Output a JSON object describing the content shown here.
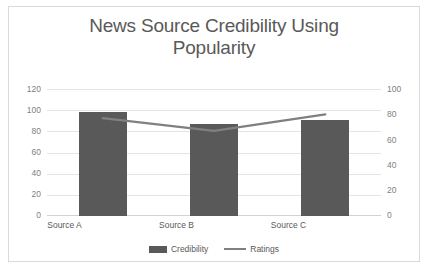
{
  "chart_data": {
    "type": "bar",
    "title": "News Source Credibility Using Popularity",
    "title_line1": "News Source Credibility Using",
    "title_line2": "Popularity",
    "xlabel": "",
    "ylabel": "",
    "categories": [
      "Source A",
      "Source B",
      "Source C"
    ],
    "series": [
      {
        "name": "Credibility",
        "type": "bar",
        "axis": "left",
        "color": "#595959",
        "values": [
          98,
          87,
          91
        ]
      },
      {
        "name": "Ratings",
        "type": "line",
        "axis": "right",
        "color": "#808080",
        "values": [
          77,
          67,
          80
        ]
      }
    ],
    "ylim": [
      0,
      120
    ],
    "y2lim": [
      0,
      100
    ],
    "yticks": [
      "0",
      "20",
      "40",
      "60",
      "80",
      "100",
      "120"
    ],
    "y2ticks": [
      "0",
      "20",
      "40",
      "60",
      "80",
      "100"
    ],
    "grid": "horizontal",
    "legend_position": "bottom",
    "legend": [
      "Credibility",
      "Ratings"
    ]
  },
  "frame": {
    "border_color": "#d9d9d9",
    "background": "#ffffff"
  }
}
